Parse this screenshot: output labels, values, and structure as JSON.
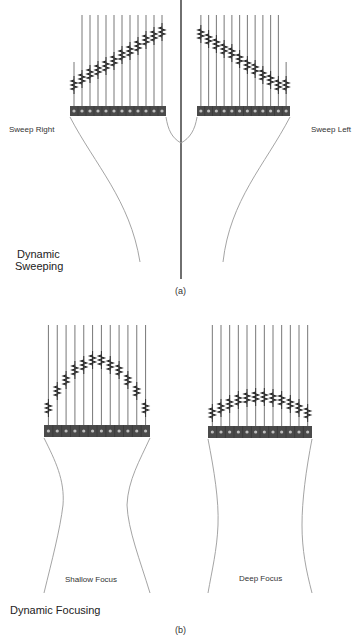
{
  "panel_a": {
    "caption": "(a)",
    "title_line1": "Dynamic",
    "title_line2": "Sweeping",
    "left_label": "Sweep Right",
    "right_label": "Sweep Left",
    "divider": {
      "x": 181,
      "y1": 0,
      "y2": 279
    },
    "arrays": [
      {
        "name": "sweep-right",
        "x0": 70,
        "x1": 166,
        "bar_top": 106,
        "bar_h": 10,
        "elements": 12,
        "line_top": 15,
        "first_line_top": 62,
        "delay_y": [
          85,
          79,
          74,
          70,
          66,
          61,
          55,
          51,
          46,
          40,
          36,
          32
        ],
        "curve": "M70,117 C95,165 130,200 140,262",
        "curve2": "M166,117 C168,130 172,138 181,143"
      },
      {
        "name": "sweep-left",
        "x0": 197,
        "x1": 290,
        "bar_top": 106,
        "bar_h": 10,
        "elements": 12,
        "line_top": 15,
        "last_line_top": 62,
        "delay_y": [
          34,
          39,
          44,
          49,
          53,
          59,
          65,
          69,
          75,
          80,
          85,
          85
        ],
        "curve": "M290,117 C265,165 230,200 223,262",
        "curve2": "M197,117 C195,130 190,138 181,143"
      }
    ]
  },
  "panel_b": {
    "caption": "(b)",
    "title": "Dynamic Focusing",
    "left_label": "Shallow Focus",
    "right_label": "Deep Focus",
    "arrays": [
      {
        "name": "shallow-focus",
        "x0": 44,
        "x1": 150,
        "bar_top": 425,
        "bar_h": 12,
        "elements": 12,
        "line_top": 325,
        "delay_y": [
          408,
          391,
          380,
          370,
          365,
          360,
          360,
          365,
          370,
          380,
          391,
          408
        ],
        "curve_left": "M44,438 C55,460 65,480 63,505 C60,530 52,560 44,593",
        "curve_right": "M150,438 C140,460 128,480 127,505 C128,530 140,560 150,593"
      },
      {
        "name": "deep-focus",
        "x0": 208,
        "x1": 312,
        "bar_top": 426,
        "bar_h": 12,
        "elements": 12,
        "line_top": 325,
        "delay_y": [
          413,
          408,
          404,
          400,
          398,
          397,
          397,
          398,
          400,
          404,
          408,
          413
        ],
        "curve_left": "M208,439 C214,470 219,500 218,525 C217,550 212,570 208,593",
        "curve_right": "M312,439 C306,470 302,500 302,525 C302,550 306,570 312,593"
      }
    ]
  },
  "colors": {
    "line": "#555555",
    "bar_fill": "#4a4a4a",
    "cell_dot": "#bdbdbd",
    "curve": "#9a9a9a",
    "divider": "#333333"
  }
}
